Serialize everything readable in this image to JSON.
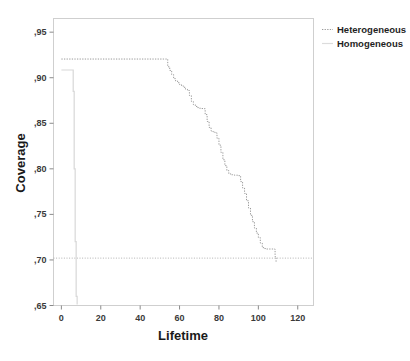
{
  "chart_data": {
    "type": "line",
    "title": "",
    "xlabel": "Lifetime",
    "ylabel": "Coverage",
    "xlim": [
      -4,
      128
    ],
    "ylim": [
      0.65,
      0.965
    ],
    "xticks": [
      0,
      20,
      40,
      60,
      80,
      100,
      120
    ],
    "xtick_labels": [
      "0",
      "20",
      "40",
      "60",
      "80",
      "100",
      "120"
    ],
    "yticks": [
      0.65,
      0.7,
      0.75,
      0.8,
      0.85,
      0.9,
      0.95
    ],
    "ytick_labels": [
      ",65",
      ",70",
      ",75",
      ",80",
      ",85",
      ",90",
      ",95"
    ],
    "grid": false,
    "legend_position": "outside-top-right",
    "decimal_separator": ",",
    "reference_line": {
      "orientation": "horizontal",
      "y": 0.702,
      "style": "dotted",
      "color": "#a9a9a9"
    },
    "series": [
      {
        "name": "Heterogeneous",
        "style": "dashed-step",
        "color": "#9a9a9a",
        "points": [
          [
            0,
            0.9205
          ],
          [
            46,
            0.9205
          ],
          [
            48,
            0.9205
          ],
          [
            52,
            0.9205
          ],
          [
            53,
            0.9205
          ],
          [
            54,
            0.912
          ],
          [
            55,
            0.908
          ],
          [
            56,
            0.9035
          ],
          [
            57,
            0.899
          ],
          [
            58,
            0.8965
          ],
          [
            59,
            0.8945
          ],
          [
            60,
            0.8925
          ],
          [
            61,
            0.891
          ],
          [
            62,
            0.8895
          ],
          [
            63,
            0.8875
          ],
          [
            64,
            0.886
          ],
          [
            65,
            0.8805
          ],
          [
            66,
            0.874
          ],
          [
            67,
            0.8705
          ],
          [
            68,
            0.8685
          ],
          [
            69,
            0.8672
          ],
          [
            70,
            0.8665
          ],
          [
            71,
            0.8662
          ],
          [
            72,
            0.866
          ],
          [
            73,
            0.8595
          ],
          [
            74,
            0.852
          ],
          [
            75,
            0.8455
          ],
          [
            76,
            0.8415
          ],
          [
            77,
            0.8405
          ],
          [
            78,
            0.8395
          ],
          [
            79,
            0.8335
          ],
          [
            80,
            0.826
          ],
          [
            81,
            0.818
          ],
          [
            82,
            0.81
          ],
          [
            83,
            0.8035
          ],
          [
            84,
            0.798
          ],
          [
            85,
            0.7945
          ],
          [
            86,
            0.7935
          ],
          [
            87,
            0.7932
          ],
          [
            88,
            0.793
          ],
          [
            89,
            0.793
          ],
          [
            90,
            0.7925
          ],
          [
            91,
            0.786
          ],
          [
            92,
            0.779
          ],
          [
            93,
            0.773
          ],
          [
            94,
            0.765
          ],
          [
            95,
            0.757
          ],
          [
            96,
            0.749
          ],
          [
            97,
            0.742
          ],
          [
            98,
            0.735
          ],
          [
            99,
            0.7295
          ],
          [
            100,
            0.7245
          ],
          [
            101,
            0.7185
          ],
          [
            102,
            0.7135
          ],
          [
            103,
            0.7125
          ],
          [
            104,
            0.712
          ],
          [
            105,
            0.712
          ],
          [
            106,
            0.712
          ],
          [
            107,
            0.712
          ],
          [
            108,
            0.712
          ],
          [
            108.5,
            0.7035
          ],
          [
            109,
            0.698
          ]
        ]
      },
      {
        "name": "Homogeneous",
        "style": "solid-step",
        "color": "#d8d8d8",
        "points": [
          [
            0,
            0.9085
          ],
          [
            3,
            0.9085
          ],
          [
            5,
            0.9085
          ],
          [
            6,
            0.885
          ],
          [
            6.5,
            0.8
          ],
          [
            7,
            0.72
          ],
          [
            7.5,
            0.66
          ],
          [
            8,
            0.651
          ]
        ]
      }
    ]
  },
  "legend": {
    "items": [
      {
        "label": "Heterogeneous",
        "swatch": "dashed-line-swatch"
      },
      {
        "label": "Homogeneous",
        "swatch": "solid-line-swatch"
      }
    ]
  },
  "axes": {
    "x_title": "Lifetime",
    "y_title": "Coverage"
  }
}
